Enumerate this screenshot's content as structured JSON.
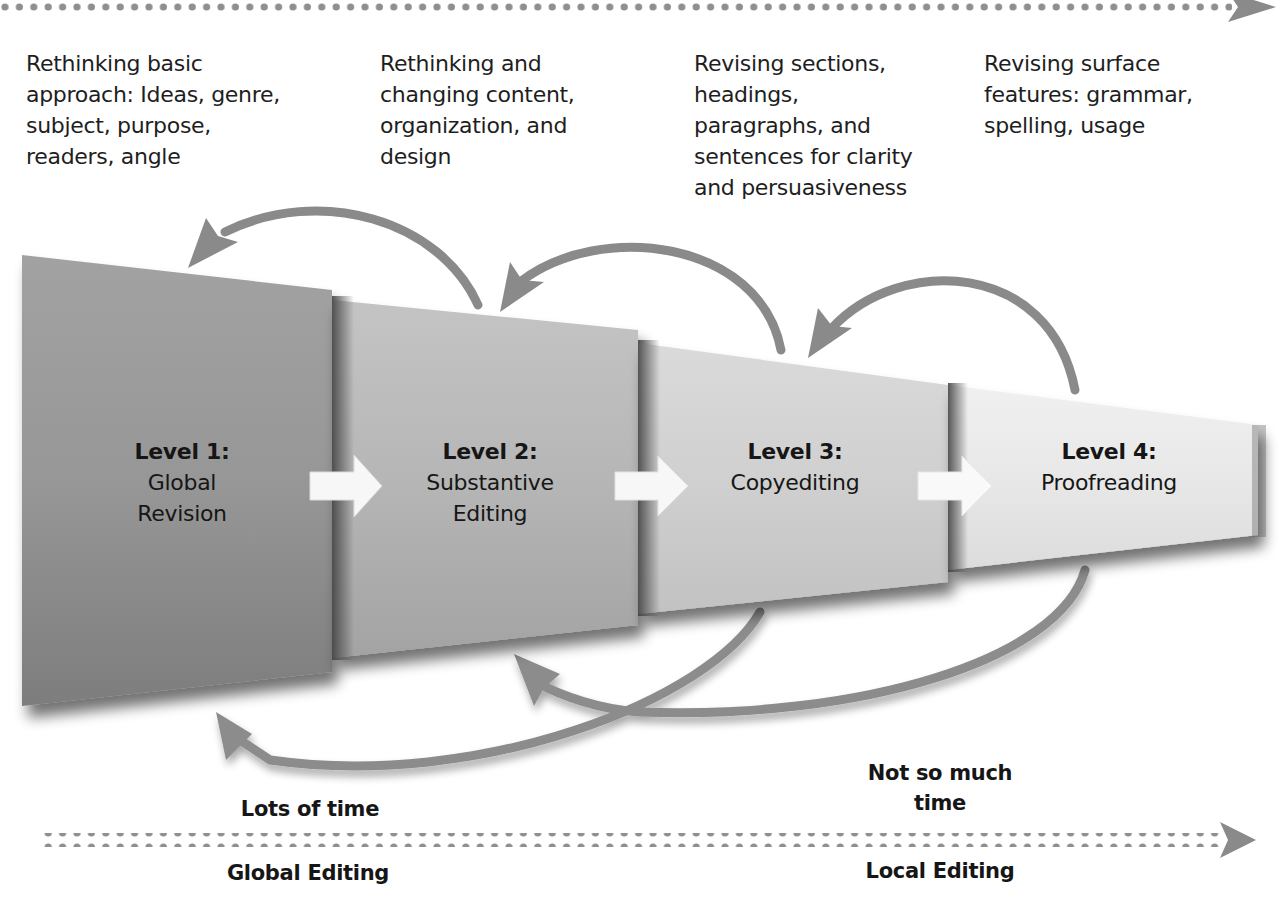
{
  "diagram": {
    "top_axis": {
      "direction": "left-to-right",
      "style": "dotted-arrow"
    },
    "descriptions": [
      {
        "level": 1,
        "text": "Rethinking basic\napproach: Ideas, genre,\nsubject, purpose,\nreaders, angle"
      },
      {
        "level": 2,
        "text": "Rethinking and\nchanging content,\norganization, and\ndesign"
      },
      {
        "level": 3,
        "text": "Revising sections,\nheadings,\nparagraphs, and\nsentences for clarity\nand persuasiveness"
      },
      {
        "level": 4,
        "text": "Revising surface\nfeatures: grammar,\nspelling, usage"
      }
    ],
    "levels": [
      {
        "label": "Level 1:",
        "name": "Global\nRevision",
        "shade": "#8e8e8e"
      },
      {
        "label": "Level 2:",
        "name": "Substantive\nEditing",
        "shade": "#b1b1b1"
      },
      {
        "label": "Level 3:",
        "name": "Copyediting",
        "shade": "#cdcdcd"
      },
      {
        "label": "Level 4:",
        "name": "Proofreading",
        "shade": "#e6e6e6"
      }
    ],
    "forward_arrows": [
      {
        "from": 1,
        "to": 2
      },
      {
        "from": 2,
        "to": 3
      },
      {
        "from": 3,
        "to": 4
      }
    ],
    "feedback_arrows_top": [
      {
        "from": 2,
        "to": 1
      },
      {
        "from": 3,
        "to": 2
      },
      {
        "from": 4,
        "to": 3
      }
    ],
    "feedback_arrows_bottom": [
      {
        "from": 3,
        "to": 1
      },
      {
        "from": 4,
        "to": 2
      }
    ],
    "time_labels": {
      "left": "Lots of time",
      "right": "Not so much\ntime"
    },
    "bottom_axis": {
      "left_label": "Global Editing",
      "right_label": "Local Editing",
      "style": "dotted-arrow"
    },
    "colors": {
      "arrow_gray": "#8a8a8a",
      "dot_gray": "#8f8f8f",
      "forward_arrow_fill": "#f7f7f7",
      "text": "#1a1a1a"
    }
  }
}
